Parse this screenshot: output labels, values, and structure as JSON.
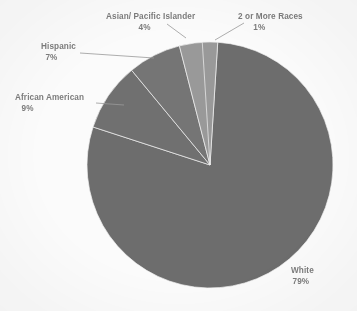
{
  "chart_data": {
    "type": "pie",
    "title": "",
    "subtitle": "",
    "xlabel": "",
    "ylabel": "",
    "legend_position": "callout-labels",
    "grid": false,
    "units": "percent",
    "categories": [
      "2 or More Races",
      "White",
      "African American",
      "Hispanic",
      "Asian/ Pacific Islander"
    ],
    "values": [
      1,
      79,
      9,
      7,
      4
    ],
    "slices": [
      {
        "label": "2 or More Races",
        "value": 1,
        "pct_text": "1%",
        "color": "#9a9a9a",
        "start_deg": 0,
        "end_deg": 3.6
      },
      {
        "label": "White",
        "value": 79,
        "pct_text": "79%",
        "color": "#6e6e6e",
        "start_deg": 3.6,
        "end_deg": 288.0
      },
      {
        "label": "African American",
        "value": 9,
        "pct_text": "9%",
        "color": "#717171",
        "start_deg": 288.0,
        "end_deg": 320.4
      },
      {
        "label": "Hispanic",
        "value": 7,
        "pct_text": "7%",
        "color": "#767676",
        "start_deg": 320.4,
        "end_deg": 345.6
      },
      {
        "label": "Asian/ Pacific Islander",
        "value": 4,
        "pct_text": "4%",
        "color": "#9a9a9a",
        "start_deg": 345.6,
        "end_deg": 360.0
      }
    ],
    "colors": {
      "white_slice": "#6e6e6e",
      "african_american_slice": "#717171",
      "hispanic_slice": "#767676",
      "asian_slice": "#9a9a9a",
      "two_or_more_slice": "#9a9a9a",
      "label_text": "#7d7d7d",
      "leader_line": "#9a9a9a",
      "background": "#fdfdfd"
    }
  },
  "labels": {
    "asian": {
      "name": "Asian/ Pacific Islander",
      "pct": "4%"
    },
    "two_or_more": {
      "name": "2 or More Races",
      "pct": "1%"
    },
    "hispanic": {
      "name": "Hispanic",
      "pct": "7%"
    },
    "african_american": {
      "name": "African American",
      "pct": "9%"
    },
    "white": {
      "name": "White",
      "pct": "79%"
    }
  }
}
